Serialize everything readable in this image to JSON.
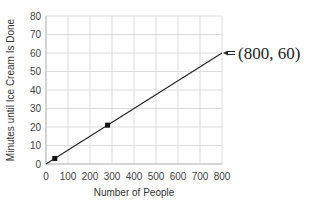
{
  "chart_data": {
    "type": "line",
    "title": "",
    "xlabel": "Number of People",
    "ylabel": "Minutes until Ice Cream Is Done",
    "xlim": [
      0,
      800
    ],
    "ylim": [
      0,
      80
    ],
    "xticks": [
      0,
      100,
      200,
      300,
      400,
      500,
      600,
      700,
      800
    ],
    "yticks": [
      0,
      10,
      20,
      30,
      40,
      50,
      60,
      70,
      80
    ],
    "grid": true,
    "legend": null,
    "series": [
      {
        "name": "line",
        "x": [
          0,
          800
        ],
        "y": [
          0,
          60
        ]
      }
    ],
    "points": [
      {
        "x": 40,
        "y": 3
      },
      {
        "x": 280,
        "y": 21
      }
    ],
    "annotations": [
      {
        "text": "(800, 60)",
        "x": 800,
        "y": 60,
        "arrow": true
      }
    ]
  }
}
